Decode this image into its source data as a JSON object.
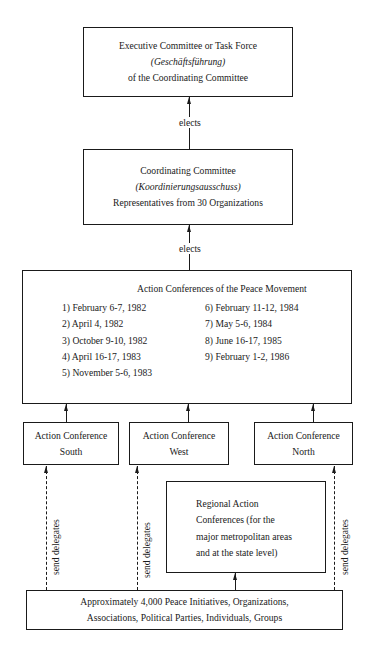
{
  "diagram": {
    "executive_box": {
      "line1": "Executive Committee or Task Force",
      "line2": "(Geschäftsführung)",
      "line3": "of the Coordinating Committee"
    },
    "coordinating_box": {
      "line1": "Coordinating Committee",
      "line2": "(Koordinierungsausschuss)",
      "line3": "Representatives from 30 Organizations"
    },
    "edge_labels": {
      "elects_top": "elects",
      "elects_middle": "elects",
      "send_delegates_south": "send delegates",
      "send_delegates_west": "send delegates",
      "send_delegates_north": "send delegates"
    },
    "action_conferences_box": {
      "title": "Action Conferences of the Peace Movement",
      "left_column": [
        "1) February 6-7, 1982",
        "2) April 4, 1982",
        "3) October 9-10, 1982",
        "4) April 16-17, 1983",
        "5) November 5-6, 1983"
      ],
      "right_column": [
        "6) February 11-12, 1984",
        "7) May 5-6, 1984",
        "8) June 16-17, 1985",
        "9) February 1-2, 1986"
      ]
    },
    "regional_conferences": [
      {
        "line1": "Action Conference",
        "line2": "South"
      },
      {
        "line1": "Action Conference",
        "line2": "West"
      },
      {
        "line1": "Action Conference",
        "line2": "North"
      }
    ],
    "regional_action_box": {
      "lines": [
        "Regional Action",
        "Conferences (for the",
        "major metropolitan areas",
        "and at the state level)"
      ]
    },
    "base_box": {
      "line1": "Approximately 4,000 Peace Initiatives, Organizations,",
      "line2": "Associations, Political Parties, Individuals, Groups"
    }
  }
}
